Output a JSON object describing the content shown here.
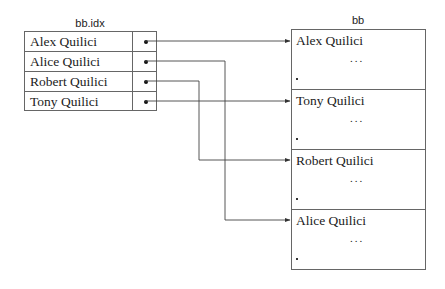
{
  "index_file": {
    "title": "bb.idx",
    "rows": [
      {
        "name": "Alex Quilici",
        "pointer": "dot-icon"
      },
      {
        "name": "Alice Quilici",
        "pointer": "dot-icon"
      },
      {
        "name": "Robert Quilici",
        "pointer": "dot-icon"
      },
      {
        "name": "Tony Quilici",
        "pointer": "dot-icon"
      }
    ]
  },
  "data_file": {
    "title": "bb",
    "records": [
      {
        "name": "Alex Quilici",
        "ellipsis": "...",
        "end_mark": "."
      },
      {
        "name": "Tony Quilici",
        "ellipsis": "...",
        "end_mark": "."
      },
      {
        "name": "Robert Quilici",
        "ellipsis": "...",
        "end_mark": "."
      },
      {
        "name": "Alice Quilici",
        "ellipsis": "...",
        "end_mark": "."
      }
    ]
  },
  "links": [
    {
      "from": "Alex Quilici",
      "to_record": 0
    },
    {
      "from": "Alice Quilici",
      "to_record": 3
    },
    {
      "from": "Robert Quilici",
      "to_record": 2
    },
    {
      "from": "Tony Quilici",
      "to_record": 1
    }
  ],
  "colors": {
    "line": "#444444",
    "border": "#666666",
    "text": "#222222"
  }
}
